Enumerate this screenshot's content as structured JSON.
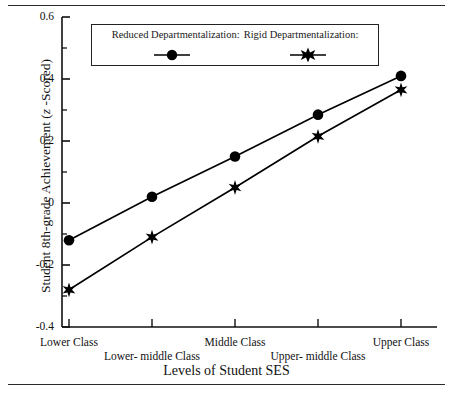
{
  "chart_data": {
    "type": "line",
    "title": "",
    "xlabel": "Levels of Student SES",
    "ylabel": "Student 8th-grade Achievement (z -Scored)",
    "ylabel_parts": {
      "before": "Student 8th-grade Achievement (",
      "italic": "z",
      "after": " -Scored)"
    },
    "categories": [
      "Lower Class",
      "Lower- middle Class",
      "Middle Class",
      "Upper- middle Class",
      "Upper Class"
    ],
    "x": [
      1,
      2,
      3,
      4,
      5
    ],
    "ylim": [
      -0.4,
      0.6
    ],
    "yticks": [
      0.6,
      0.4,
      0.2,
      0,
      -0.2,
      -0.4
    ],
    "ytick_labels": [
      "0.6",
      "0.4",
      "0.2",
      "0",
      "-0.2",
      "-0.4"
    ],
    "grid": false,
    "legend_position": "top-inside",
    "series": [
      {
        "name": "Reduced Departmentalization:",
        "marker": "circle",
        "color": "#000000",
        "values": [
          -0.12,
          0.02,
          0.15,
          0.285,
          0.41
        ]
      },
      {
        "name": "Rigid Departmentalization:",
        "marker": "star",
        "color": "#000000",
        "values": [
          -0.28,
          -0.11,
          0.05,
          0.215,
          0.365
        ]
      }
    ]
  },
  "legend": {
    "entries": [
      {
        "label": "Reduced Departmentalization:",
        "marker": "circle-marker-icon"
      },
      {
        "label": "Rigid Departmentalization:",
        "marker": "star-marker-icon"
      }
    ]
  }
}
